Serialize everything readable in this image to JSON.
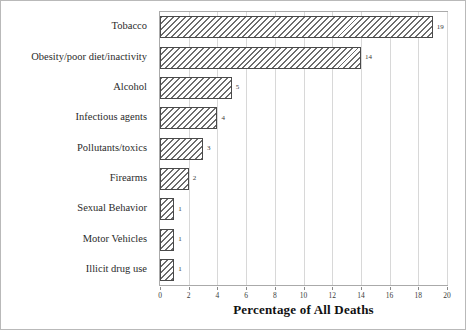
{
  "chart_data": {
    "type": "bar",
    "orientation": "horizontal",
    "title": "",
    "xlabel": "Percentage of All Deaths",
    "ylabel": "",
    "xlim": [
      0,
      20
    ],
    "ylim": null,
    "grid": true,
    "legend": null,
    "xticks": [
      "0",
      "2",
      "4",
      "6",
      "8",
      "10",
      "12",
      "14",
      "16",
      "18",
      "20"
    ],
    "xtick_values": [
      0,
      2,
      4,
      6,
      8,
      10,
      12,
      14,
      16,
      18,
      20
    ],
    "categories": [
      "Tobacco",
      "Obesity/poor diet/inactivity",
      "Alcohol",
      "Infectious agents",
      "Pollutants/toxics",
      "Firearms",
      "Sexual Behavior",
      "Motor Vehicles",
      "Illicit drug use"
    ],
    "values": [
      19,
      14,
      5,
      4,
      3,
      2,
      1,
      1,
      1
    ],
    "value_labels": [
      "19",
      "14",
      "5",
      "4",
      "3",
      "2",
      "1",
      "1",
      "1"
    ],
    "bar_style": {
      "fill": "#ffffff",
      "hatch": "diagonal-lines",
      "edge_color": "#4a4a4a"
    }
  },
  "figure": {
    "border_color": "#b9b9b9",
    "background": "#ffffff",
    "plot_border_color": "#aaaaaa",
    "gridline_color": "#d8d8d8"
  }
}
